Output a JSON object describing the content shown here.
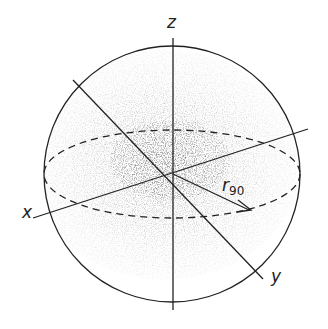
{
  "diagram": {
    "title": "",
    "axes": {
      "z_label": "z",
      "x_label": "x",
      "y_label": "y"
    },
    "radius_label": {
      "main": "r",
      "subscript": "90"
    },
    "colors": {
      "line": "#222222",
      "dots": "#555555",
      "background": "#ffffff"
    }
  }
}
